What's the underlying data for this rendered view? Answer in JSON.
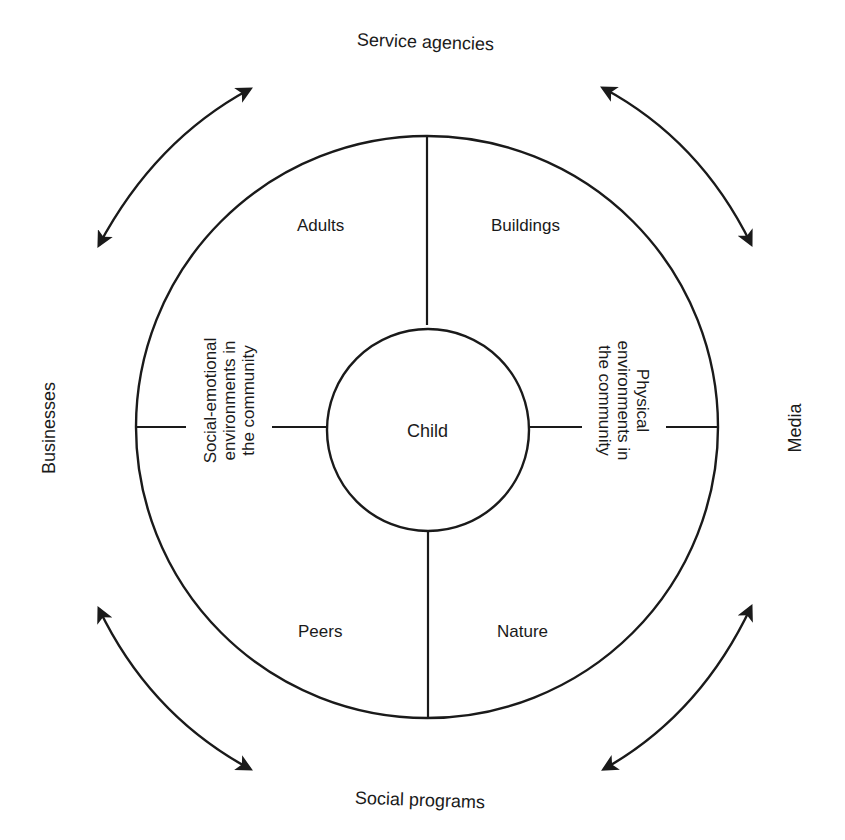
{
  "diagram": {
    "type": "concentric-circle-diagram",
    "center": {
      "label": "Child"
    },
    "quadrants": [
      {
        "position": "top-left",
        "label": "Adults"
      },
      {
        "position": "top-right",
        "label": "Buildings"
      },
      {
        "position": "bottom-left",
        "label": "Peers"
      },
      {
        "position": "bottom-right",
        "label": "Nature"
      }
    ],
    "side_labels": {
      "left": {
        "lines": [
          "Social-emotional",
          "environments in",
          "the community"
        ]
      },
      "right": {
        "lines": [
          "Physical",
          "environments in",
          "the community"
        ]
      }
    },
    "outer_labels": {
      "top": "Service agencies",
      "bottom": "Social programs",
      "left": "Businesses",
      "right": "Media"
    },
    "arrows": [
      {
        "position": "top-left",
        "type": "double-headed-arc"
      },
      {
        "position": "top-right",
        "type": "double-headed-arc"
      },
      {
        "position": "bottom-left",
        "type": "double-headed-arc"
      },
      {
        "position": "bottom-right",
        "type": "double-headed-arc"
      }
    ],
    "colors": {
      "stroke": "#1a1a1a",
      "background": "#ffffff"
    }
  }
}
